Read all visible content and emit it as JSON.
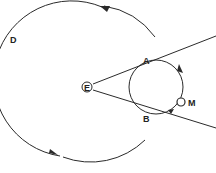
{
  "diagram": {
    "labels": {
      "big_circle": "D",
      "center": "E",
      "upper_intersection": "A",
      "lower_intersection": "B",
      "small_body": "M"
    },
    "colors": {
      "stroke": "#2a2a2a",
      "background": "#ffffff"
    }
  }
}
